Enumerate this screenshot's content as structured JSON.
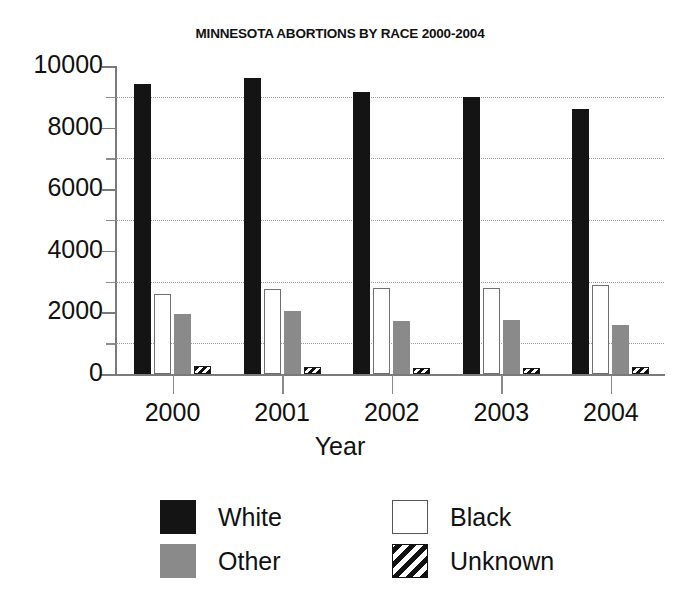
{
  "chart_data": {
    "type": "bar",
    "title": "MINNESOTA ABORTIONS BY RACE 2000-2004",
    "xlabel": "Year",
    "ylabel": "",
    "categories": [
      "2000",
      "2001",
      "2002",
      "2003",
      "2004"
    ],
    "ylim": [
      0,
      10000
    ],
    "yticks": [
      0,
      2000,
      4000,
      6000,
      8000,
      10000
    ],
    "ytick_labels": [
      "0",
      "2000",
      "4000",
      "6000",
      "8000",
      "10000"
    ],
    "yminor_ticks": [
      1000,
      3000,
      5000,
      7000,
      9000
    ],
    "grid": "horizontal-dotted-at-minor-ticks",
    "legend_position": "below-plot",
    "series": [
      {
        "name": "White",
        "values": [
          9400,
          9600,
          9150,
          9000,
          8600
        ],
        "fill": "#141414",
        "pattern": "solid"
      },
      {
        "name": "Black",
        "values": [
          2600,
          2750,
          2780,
          2800,
          2900
        ],
        "fill": "#ffffff",
        "pattern": "outline"
      },
      {
        "name": "Other",
        "values": [
          1950,
          2050,
          1720,
          1760,
          1580
        ],
        "fill": "#8a8a8a",
        "pattern": "solid"
      },
      {
        "name": "Unknown",
        "values": [
          250,
          230,
          210,
          200,
          220
        ],
        "fill": "#ffffff",
        "pattern": "diagonal-hatch"
      }
    ]
  },
  "legend": {
    "entries": [
      {
        "label": "White",
        "swatch": "white-swatch"
      },
      {
        "label": "Black",
        "swatch": "black-swatch"
      },
      {
        "label": "Other",
        "swatch": "other-swatch"
      },
      {
        "label": "Unknown",
        "swatch": "unknown-swatch"
      }
    ]
  },
  "colors": {
    "white_series": "#141414",
    "black_series": "#ffffff",
    "other_series": "#8a8a8a",
    "unknown_series": "#111111",
    "axis": "#7a7a7a",
    "grid": "#9a9a9a",
    "text": "#111111",
    "background": "#ffffff"
  }
}
